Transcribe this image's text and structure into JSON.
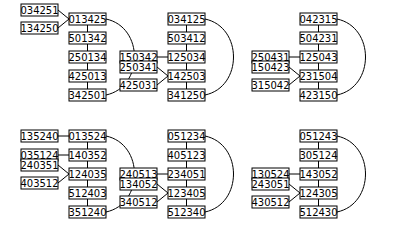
{
  "panels": [
    {
      "id": "p1",
      "spine": [
        "013425",
        "501342",
        "250134",
        "425013",
        "342501"
      ],
      "attachments": [
        {
          "label": "034251",
          "to": 0
        },
        {
          "label": "134250",
          "to": 0
        }
      ],
      "loop": [
        0,
        4
      ]
    },
    {
      "id": "p2",
      "spine": [
        "034125",
        "503412",
        "125034",
        "142503",
        "341250"
      ],
      "attachments": [
        {
          "label": "150342",
          "to": 2
        },
        {
          "label": "250341",
          "to": 3
        },
        {
          "label": "425031",
          "to": 3
        }
      ],
      "loop": [
        0,
        4
      ]
    },
    {
      "id": "p3",
      "spine": [
        "042315",
        "504231",
        "125043",
        "231504",
        "423150"
      ],
      "attachments": [
        {
          "label": "250431",
          "to": 2
        },
        {
          "label": "150423",
          "to": 3
        },
        {
          "label": "315042",
          "to": 3
        }
      ],
      "loop": [
        0,
        4
      ]
    },
    {
      "id": "p4",
      "spine": [
        "013524",
        "140352",
        "124035",
        "512403",
        "351240"
      ],
      "attachments": [
        {
          "label": "135240",
          "to": 0
        },
        {
          "label": "035124",
          "to": 1
        },
        {
          "label": "240351",
          "to": 2
        },
        {
          "label": "403512",
          "to": 2
        }
      ],
      "loop": [
        0,
        4
      ]
    },
    {
      "id": "p5",
      "spine": [
        "051234",
        "405123",
        "234051",
        "123405",
        "512340"
      ],
      "attachments": [
        {
          "label": "240513",
          "to": 2
        },
        {
          "label": "134052",
          "to": 3
        },
        {
          "label": "340512",
          "to": 3
        }
      ],
      "loop": [
        0,
        4
      ]
    },
    {
      "id": "p6",
      "spine": [
        "051243",
        "305124",
        "143052",
        "124305",
        "512430"
      ],
      "attachments": [
        {
          "label": "130524",
          "to": 2
        },
        {
          "label": "243051",
          "to": 3
        },
        {
          "label": "430512",
          "to": 3
        }
      ],
      "loop": [
        0,
        4
      ]
    }
  ]
}
